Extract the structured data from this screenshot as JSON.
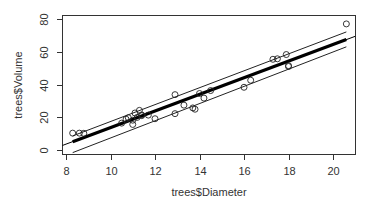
{
  "chart_data": {
    "type": "scatter",
    "title": "",
    "xlabel": "trees$Diameter",
    "ylabel": "trees$Volume",
    "xlim": [
      7.8,
      21.0
    ],
    "ylim": [
      -3,
      83
    ],
    "x_ticks": [
      8,
      10,
      12,
      14,
      16,
      18,
      20
    ],
    "y_ticks": [
      0,
      20,
      40,
      60,
      80
    ],
    "grid": false,
    "legend": null,
    "points": {
      "x": [
        8.3,
        8.6,
        8.8,
        10.5,
        10.7,
        10.8,
        11.0,
        11.0,
        11.1,
        11.2,
        11.3,
        11.4,
        11.4,
        11.7,
        12.0,
        12.9,
        12.9,
        13.3,
        13.7,
        13.8,
        14.0,
        14.2,
        14.5,
        16.0,
        16.3,
        17.3,
        17.5,
        17.9,
        18.0,
        18.0,
        20.6
      ],
      "y": [
        10.3,
        10.3,
        10.2,
        16.4,
        18.8,
        19.7,
        15.6,
        18.2,
        22.6,
        19.9,
        24.2,
        21.0,
        21.4,
        21.3,
        19.1,
        22.2,
        33.8,
        27.4,
        25.7,
        24.9,
        34.5,
        31.7,
        36.3,
        38.3,
        42.6,
        55.4,
        55.7,
        58.3,
        51.5,
        51.0,
        77.0
      ],
      "marker": "open-circle"
    },
    "regression": {
      "intercept": -36.94,
      "slope": 5.066,
      "fit_range": [
        8.3,
        20.6
      ],
      "band_upper": {
        "x": [
          8.3,
          20.6
        ],
        "y": [
          8.6,
          72.1
        ]
      },
      "band_lower": {
        "x": [
          8.3,
          20.6
        ],
        "y": [
          -1.6,
          63.0
        ]
      }
    }
  },
  "labels": {
    "xlabel": "trees$Diameter",
    "ylabel": "trees$Volume",
    "x_tick_labels": [
      "8",
      "10",
      "12",
      "14",
      "16",
      "18",
      "20"
    ],
    "y_tick_labels": [
      "0",
      "20",
      "40",
      "60",
      "80"
    ]
  },
  "colors": {
    "axis": "#333333",
    "points": "#222222",
    "fit_line": "#000000",
    "band": "#222222"
  }
}
